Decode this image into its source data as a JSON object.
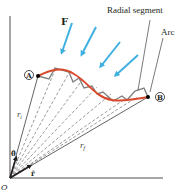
{
  "figure": {
    "labels": {
      "force": "F",
      "radial_segment": "Radial segment",
      "arc": "Arc",
      "point_a": "A",
      "point_b": "B",
      "r_initial": "r",
      "r_initial_sub": "i",
      "r_final": "r",
      "r_final_sub": "f",
      "unit_theta": "θ̂",
      "unit_r": "r̂",
      "origin": "O"
    },
    "colors": {
      "path": "#d9482b",
      "force_arrows": "#3fb0e0",
      "segments": "#808080",
      "axes": "#231f20",
      "dashed": "#555555"
    }
  }
}
